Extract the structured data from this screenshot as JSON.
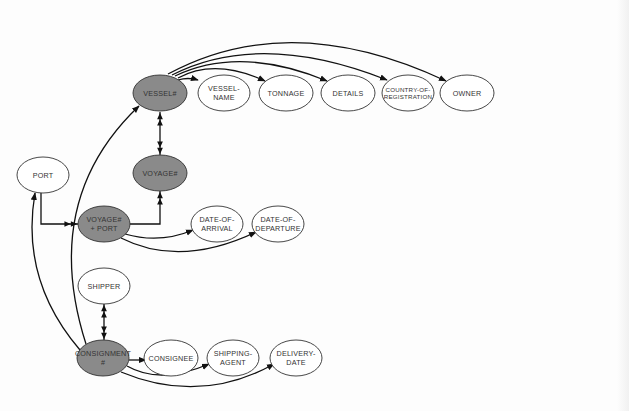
{
  "diagram": {
    "type": "entity-attribute-dependency-graph",
    "colors": {
      "key_fill": "#8a8a8a",
      "attr_fill": "#ffffff",
      "stroke": "#333333",
      "edge": "#111111"
    },
    "nodes": [
      {
        "id": "vessel",
        "lines": [
          "VESSEL#"
        ],
        "kind": "key",
        "cx": 160,
        "cy": 93,
        "rx": 27,
        "ry": 18
      },
      {
        "id": "vessel_name",
        "lines": [
          "VESSEL-",
          "NAME"
        ],
        "kind": "attribute",
        "cx": 224,
        "cy": 93,
        "rx": 26,
        "ry": 18
      },
      {
        "id": "tonnage",
        "lines": [
          "TONNAGE"
        ],
        "kind": "attribute",
        "cx": 286,
        "cy": 93,
        "rx": 27,
        "ry": 18
      },
      {
        "id": "details",
        "lines": [
          "DETAILS"
        ],
        "kind": "attribute",
        "cx": 348,
        "cy": 93,
        "rx": 27,
        "ry": 18
      },
      {
        "id": "country_of_registration",
        "lines": [
          "COUNTRY-OF-",
          "REGISTRATION"
        ],
        "kind": "attribute",
        "cx": 408,
        "cy": 93,
        "rx": 26,
        "ry": 18,
        "small": true
      },
      {
        "id": "owner",
        "lines": [
          "OWNER"
        ],
        "kind": "attribute",
        "cx": 467,
        "cy": 93,
        "rx": 27,
        "ry": 18
      },
      {
        "id": "port",
        "lines": [
          "PORT"
        ],
        "kind": "attribute",
        "cx": 43,
        "cy": 175,
        "rx": 26,
        "ry": 18
      },
      {
        "id": "voyage",
        "lines": [
          "VOYAGE#"
        ],
        "kind": "key",
        "cx": 160,
        "cy": 173,
        "rx": 27,
        "ry": 18
      },
      {
        "id": "voyage_port",
        "lines": [
          "VOYAGE#",
          "+ PORT"
        ],
        "kind": "key",
        "cx": 104,
        "cy": 224,
        "rx": 26,
        "ry": 18
      },
      {
        "id": "date_of_arrival",
        "lines": [
          "DATE-OF-",
          "ARRIVAL"
        ],
        "kind": "attribute",
        "cx": 217,
        "cy": 224,
        "rx": 26,
        "ry": 18
      },
      {
        "id": "date_of_departure",
        "lines": [
          "DATE-OF-",
          "DEPARTURE"
        ],
        "kind": "attribute",
        "cx": 278,
        "cy": 224,
        "rx": 26,
        "ry": 18
      },
      {
        "id": "shipper",
        "lines": [
          "SHIPPER"
        ],
        "kind": "attribute",
        "cx": 104,
        "cy": 286,
        "rx": 26,
        "ry": 18
      },
      {
        "id": "consignment",
        "lines": [
          "CONSIGNMENT",
          "#"
        ],
        "kind": "key",
        "cx": 103,
        "cy": 358,
        "rx": 26,
        "ry": 18
      },
      {
        "id": "consignee",
        "lines": [
          "CONSIGNEE"
        ],
        "kind": "attribute",
        "cx": 171,
        "cy": 358,
        "rx": 27,
        "ry": 18
      },
      {
        "id": "shipping_agent",
        "lines": [
          "SHIPPING-",
          "AGENT"
        ],
        "kind": "attribute",
        "cx": 233,
        "cy": 358,
        "rx": 26,
        "ry": 18
      },
      {
        "id": "delivery_date",
        "lines": [
          "DELIVERY-",
          "DATE"
        ],
        "kind": "attribute",
        "cx": 296,
        "cy": 358,
        "rx": 26,
        "ry": 18
      }
    ],
    "edges": [
      {
        "from": "vessel",
        "to": "vessel_name",
        "style": "single",
        "d": "M178,80 Q188,77 198,80"
      },
      {
        "from": "vessel",
        "to": "tonnage",
        "style": "single",
        "d": "M178,78 Q215,58 265,81"
      },
      {
        "from": "vessel",
        "to": "details",
        "style": "single",
        "d": "M175,76 Q240,45 327,81"
      },
      {
        "from": "vessel",
        "to": "country_of_registration",
        "style": "single",
        "d": "M172,75 Q260,30 387,80"
      },
      {
        "from": "vessel",
        "to": "owner",
        "style": "single",
        "d": "M168,74 Q290,8 446,81"
      },
      {
        "from": "vessel",
        "to": "voyage",
        "style": "double-bidirectional",
        "d": "M160,112 L160,155"
      },
      {
        "from": "voyage_port",
        "to": "voyage",
        "style": "double-to-key",
        "d": "M130,224 L160,224 L160,191"
      },
      {
        "from": "port",
        "to": "voyage_port",
        "style": "double-to-key",
        "d": "M41,193 L41,224 L78,224"
      },
      {
        "from": "voyage_port",
        "to": "date_of_arrival",
        "style": "single",
        "d": "M125,234 Q160,244 193,230"
      },
      {
        "from": "voyage_port",
        "to": "date_of_departure",
        "style": "single",
        "d": "M121,238 Q180,268 256,232"
      },
      {
        "from": "consignment",
        "to": "vessel",
        "style": "single",
        "d": "M86,344 Q40,200 139,106"
      },
      {
        "from": "consignment",
        "to": "port",
        "style": "single",
        "d": "M80,350 Q20,280 35,193"
      },
      {
        "from": "consignment",
        "to": "shipper",
        "style": "double-bidirectional",
        "d": "M104,340 L104,304"
      },
      {
        "from": "consignment",
        "to": "consignee",
        "style": "single",
        "d": "M129,360 L146,360"
      },
      {
        "from": "consignment",
        "to": "shipping_agent",
        "style": "single",
        "d": "M127,366 Q160,385 209,364"
      },
      {
        "from": "consignment",
        "to": "delivery_date",
        "style": "single",
        "d": "M121,372 Q200,405 274,364"
      }
    ]
  }
}
